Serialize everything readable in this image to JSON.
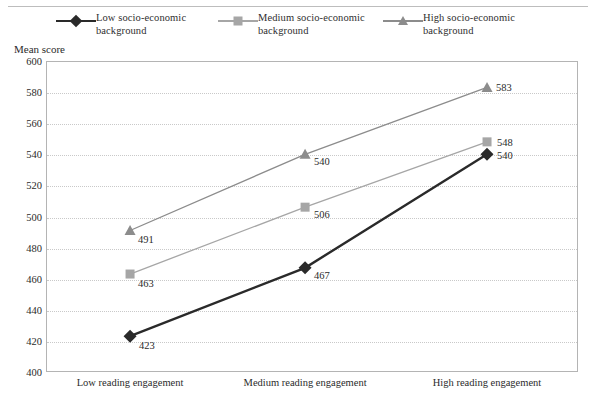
{
  "axis_title": "Mean score",
  "legend": {
    "items": [
      {
        "label": "Low socio-economic background",
        "marker": "diamond-marker-icon",
        "color": "#2a2a2a"
      },
      {
        "label": "Medium socio-economic background",
        "marker": "square-marker-icon",
        "color": "#a6a6a6"
      },
      {
        "label": "High socio-economic background",
        "marker": "triangle-marker-icon",
        "color": "#8c8c8c"
      }
    ]
  },
  "chart_data": {
    "type": "line",
    "title": "",
    "xlabel": "",
    "ylabel": "Mean score",
    "categories": [
      "Low reading engagement",
      "Medium reading engagement",
      "High reading engagement"
    ],
    "series": [
      {
        "name": "Low socio-economic background",
        "values": [
          423,
          467,
          540
        ],
        "color": "#2a2a2a",
        "marker": "diamond"
      },
      {
        "name": "Medium socio-economic background",
        "values": [
          463,
          506,
          548
        ],
        "color": "#a6a6a6",
        "marker": "square"
      },
      {
        "name": "High socio-economic background",
        "values": [
          491,
          540,
          583
        ],
        "color": "#8c8c8c",
        "marker": "triangle"
      }
    ],
    "ylim": [
      400,
      600
    ],
    "yticks": [
      400,
      420,
      440,
      460,
      480,
      500,
      520,
      540,
      560,
      580,
      600
    ],
    "ytick_labels": [
      "400",
      "420",
      "440",
      "460",
      "480",
      "500",
      "520",
      "540",
      "560",
      "580",
      "600"
    ],
    "grid": true,
    "legend_position": "top",
    "data_labels": [
      {
        "series": "Low socio-economic background",
        "category": "Low reading engagement",
        "value": 423,
        "text": "423"
      },
      {
        "series": "Low socio-economic background",
        "category": "Medium reading engagement",
        "value": 467,
        "text": "467"
      },
      {
        "series": "Low socio-economic background",
        "category": "High reading engagement",
        "value": 540,
        "text": "540"
      },
      {
        "series": "Medium socio-economic background",
        "category": "Low reading engagement",
        "value": 463,
        "text": "463"
      },
      {
        "series": "Medium socio-economic background",
        "category": "Medium reading engagement",
        "value": 506,
        "text": "506"
      },
      {
        "series": "Medium socio-economic background",
        "category": "High reading engagement",
        "value": 548,
        "text": "548"
      },
      {
        "series": "High socio-economic background",
        "category": "Low reading engagement",
        "value": 491,
        "text": "491"
      },
      {
        "series": "High socio-economic background",
        "category": "Medium reading engagement",
        "value": 540,
        "text": "540"
      },
      {
        "series": "High socio-economic background",
        "category": "High reading engagement",
        "value": 583,
        "text": "583"
      }
    ]
  }
}
